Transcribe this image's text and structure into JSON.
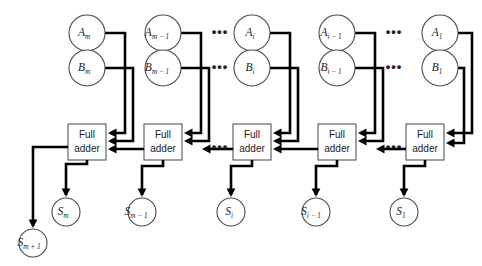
{
  "figure": {
    "background_color": "#ffffff",
    "wire_color": "#000000",
    "node_stroke_color": "#4a4a4a",
    "box_stroke_color": "#555555",
    "text_color": "#1a1a1a",
    "width": 482,
    "height": 266
  },
  "stages": [
    {
      "id": "stage-m",
      "operand_a": {
        "base": "A",
        "sub": "m",
        "label": "Am"
      },
      "operand_b": {
        "base": "B",
        "sub": "m",
        "label": "Bm"
      },
      "adder": {
        "line1": "Full",
        "line2": "adder"
      },
      "sum": {
        "base": "S",
        "sub": "m",
        "label": "Sm"
      }
    },
    {
      "id": "stage-m-minus-1",
      "operand_a": {
        "base": "A",
        "sub": "m − 1",
        "label": "Am-1"
      },
      "operand_b": {
        "base": "B",
        "sub": "m − 1",
        "label": "Bm-1"
      },
      "adder": {
        "line1": "Full",
        "line2": "adder"
      },
      "sum": {
        "base": "S",
        "sub": "m − 1",
        "label": "Sm-1"
      }
    },
    {
      "id": "stage-i",
      "operand_a": {
        "base": "A",
        "sub": "i",
        "label": "Ai"
      },
      "operand_b": {
        "base": "B",
        "sub": "i",
        "label": "Bi"
      },
      "adder": {
        "line1": "Full",
        "line2": "adder"
      },
      "sum": {
        "base": "S",
        "sub": "i",
        "label": "Si"
      }
    },
    {
      "id": "stage-i-minus-1",
      "operand_a": {
        "base": "A",
        "sub": "i − 1",
        "label": "Ai-1"
      },
      "operand_b": {
        "base": "B",
        "sub": "i − 1",
        "label": "Bi-1"
      },
      "adder": {
        "line1": "Full",
        "line2": "adder"
      },
      "sum": {
        "base": "S",
        "sub": "i − 1",
        "label": "Si-1"
      }
    },
    {
      "id": "stage-1",
      "operand_a": {
        "base": "A",
        "sub": "1",
        "label": "A1"
      },
      "operand_b": {
        "base": "B",
        "sub": "1",
        "label": "B1"
      },
      "adder": {
        "line1": "Full",
        "line2": "adder"
      },
      "sum": {
        "base": "S",
        "sub": "1",
        "label": "S1"
      }
    }
  ],
  "carry_out": {
    "base": "S",
    "sub": "m + 1",
    "label": "Sm+1"
  },
  "ellipses": {
    "glyph": "•••",
    "positions": [
      "operand-a-row-left",
      "operand-b-row-left",
      "operand-a-row-right",
      "operand-b-row-right",
      "carry-row-left",
      "carry-row-right"
    ]
  }
}
